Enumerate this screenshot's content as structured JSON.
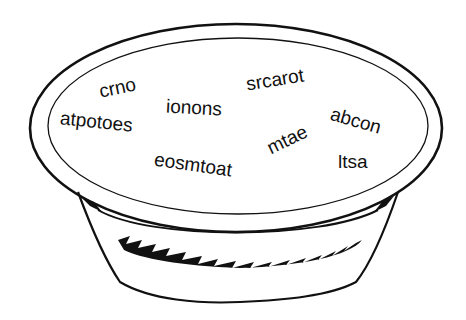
{
  "figure": {
    "stroke_color": "#111111",
    "background": "#ffffff"
  },
  "words": [
    {
      "text": "crno",
      "x": 120,
      "y": 88,
      "rotate": -12
    },
    {
      "text": "atpotoes",
      "x": 102,
      "y": 122,
      "rotate": 6
    },
    {
      "text": "ionons",
      "x": 197,
      "y": 108,
      "rotate": 3
    },
    {
      "text": "srcarot",
      "x": 277,
      "y": 80,
      "rotate": -9
    },
    {
      "text": "abcon",
      "x": 357,
      "y": 121,
      "rotate": 16
    },
    {
      "text": "mtae",
      "x": 289,
      "y": 140,
      "rotate": -26
    },
    {
      "text": "ltsa",
      "x": 354,
      "y": 162,
      "rotate": 0
    },
    {
      "text": "eosmtoat",
      "x": 197,
      "y": 166,
      "rotate": 8
    }
  ]
}
